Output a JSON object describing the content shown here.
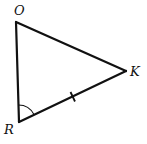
{
  "diagram": {
    "type": "triangle",
    "stroke_color": "#111111",
    "background": "#ffffff",
    "vertices": [
      {
        "name": "O",
        "x": 16,
        "y": 22,
        "label_x": 14,
        "label_y": 15
      },
      {
        "name": "K",
        "x": 126,
        "y": 71,
        "label_x": 131,
        "label_y": 76
      },
      {
        "name": "R",
        "x": 19,
        "y": 122,
        "label_x": 4,
        "label_y": 134
      }
    ],
    "edges": [
      {
        "from": "O",
        "to": "K"
      },
      {
        "from": "K",
        "to": "R",
        "tick_marks": 1
      },
      {
        "from": "R",
        "to": "O"
      }
    ],
    "angle_marks": [
      {
        "vertex": "R",
        "arcs": 1
      }
    ],
    "labels": {
      "O": "O",
      "K": "K",
      "R": "R"
    }
  }
}
